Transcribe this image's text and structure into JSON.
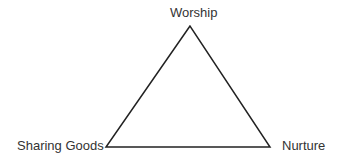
{
  "diagram": {
    "type": "triangle",
    "vertices": {
      "top": {
        "label": "Worship",
        "x": 190,
        "y": 26
      },
      "bottom_left": {
        "label": "Sharing Goods",
        "x": 106,
        "y": 147
      },
      "bottom_right": {
        "label": "Nurture",
        "x": 270,
        "y": 147
      }
    },
    "edges": [
      [
        "Worship",
        "Sharing Goods"
      ],
      [
        "Sharing Goods",
        "Nurture"
      ],
      [
        "Nurture",
        "Worship"
      ]
    ],
    "colors": {
      "line": "#222222",
      "text": "#333333",
      "background": "#ffffff"
    }
  }
}
